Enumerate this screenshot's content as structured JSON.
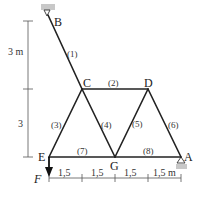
{
  "diagram": {
    "type": "truss",
    "joints": [
      {
        "id": "B",
        "label": "B",
        "x": 50,
        "y": 20,
        "support": "pin-top"
      },
      {
        "id": "C",
        "label": "C",
        "x": 82,
        "y": 89
      },
      {
        "id": "D",
        "label": "D",
        "x": 148,
        "y": 89
      },
      {
        "id": "E",
        "label": "E",
        "x": 49,
        "y": 157
      },
      {
        "id": "G",
        "label": "G",
        "x": 115,
        "y": 157
      },
      {
        "id": "A",
        "label": "A",
        "x": 181,
        "y": 157,
        "support": "roller"
      }
    ],
    "members": [
      {
        "label": "(1)",
        "from": "B",
        "to": "C"
      },
      {
        "label": "(2)",
        "from": "C",
        "to": "D"
      },
      {
        "label": "(3)",
        "from": "C",
        "to": "E"
      },
      {
        "label": "(4)",
        "from": "C",
        "to": "G"
      },
      {
        "label": "(5)",
        "from": "D",
        "to": "G"
      },
      {
        "label": "(6)",
        "from": "D",
        "to": "A"
      },
      {
        "label": "(7)",
        "from": "E",
        "to": "G"
      },
      {
        "label": "(8)",
        "from": "G",
        "to": "A"
      }
    ],
    "load": {
      "label": "F",
      "at": "E",
      "direction": "down"
    },
    "vertical_dimensions": [
      "3 m",
      "3"
    ],
    "horizontal_dimensions": [
      "1,5",
      "1,5",
      "1,5",
      "1,5 m"
    ]
  }
}
